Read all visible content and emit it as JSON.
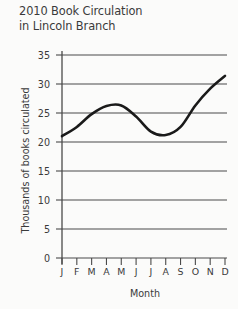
{
  "chart_data": {
    "type": "line",
    "title": "2010 Book Circulation\nin Lincoln Branch",
    "title_line_1": "2010 Book Circulation",
    "title_line_2": "in Lincoln Branch",
    "xlabel": "Month",
    "ylabel": "Thousands of books circulated",
    "categories": [
      "J",
      "F",
      "M",
      "A",
      "M",
      "J",
      "J",
      "A",
      "S",
      "O",
      "N",
      "D"
    ],
    "category_names": [
      "January",
      "February",
      "March",
      "April",
      "May",
      "June",
      "July",
      "August",
      "September",
      "October",
      "November",
      "December"
    ],
    "values": [
      21.0,
      22.6,
      24.8,
      26.2,
      26.3,
      24.4,
      21.8,
      21.2,
      22.6,
      26.3,
      29.2,
      31.4
    ],
    "series": [
      {
        "name": "Book circulation",
        "values": [
          21.0,
          22.6,
          24.8,
          26.2,
          26.3,
          24.4,
          21.8,
          21.2,
          22.6,
          26.3,
          29.2,
          31.4
        ]
      }
    ],
    "ylim": [
      0,
      35
    ],
    "yticks": [
      0,
      5,
      10,
      15,
      20,
      25,
      30,
      35
    ],
    "ytick_labels": [
      "0",
      "5",
      "10",
      "15",
      "20",
      "25",
      "30",
      "35"
    ],
    "grid": true,
    "grid_axis": "y",
    "legend": false,
    "legend_position": "none",
    "line_color": "#1a1a1a",
    "grid_color": "#4a4a4a",
    "axis_color": "#4a4a4a",
    "background_color": "#fbfbfa",
    "text_color": "#3a3a3a",
    "markers": false,
    "smooth": true
  }
}
